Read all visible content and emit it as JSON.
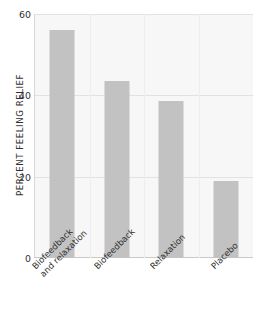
{
  "chart_data": {
    "type": "bar",
    "title": "",
    "xlabel": "",
    "ylabel": "PERCENT FEELING RELIEF",
    "ylim": [
      0,
      60
    ],
    "yticks": [
      0,
      20,
      40,
      60
    ],
    "ytick_labels": [
      "0",
      "20",
      "40",
      "60"
    ],
    "grid": "horizontal",
    "legend": "none",
    "categories": [
      "Biofeedback and relaxation",
      "Biofeedback",
      "Relaxation",
      "Placebo"
    ],
    "category_lines": [
      [
        "Biofeedback",
        "and relaxation"
      ],
      [
        "Biofeedback"
      ],
      [
        "Relaxation"
      ],
      [
        "Placebo"
      ]
    ],
    "values": [
      56,
      43.5,
      38.5,
      19
    ],
    "bar_color": "#c2c2c2",
    "plot_background": "#f7f7f7",
    "gridline_color": "#e2e2e2",
    "axis_color": "#c9c9c9",
    "text_color": "#2f2f2f"
  }
}
